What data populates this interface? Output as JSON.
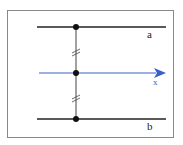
{
  "diagram": {
    "lines": [
      {
        "label": "a",
        "y": 27,
        "color": "#222222"
      },
      {
        "label": "x",
        "y": 73,
        "color": "#3a5fc8",
        "arrow": true
      },
      {
        "label": "b",
        "y": 119,
        "color": "#222222"
      }
    ],
    "transversal_x": 76,
    "tick_marks": "equal-segment marks (//)",
    "labels": {
      "a": "a",
      "x": "x",
      "b": "b"
    }
  }
}
